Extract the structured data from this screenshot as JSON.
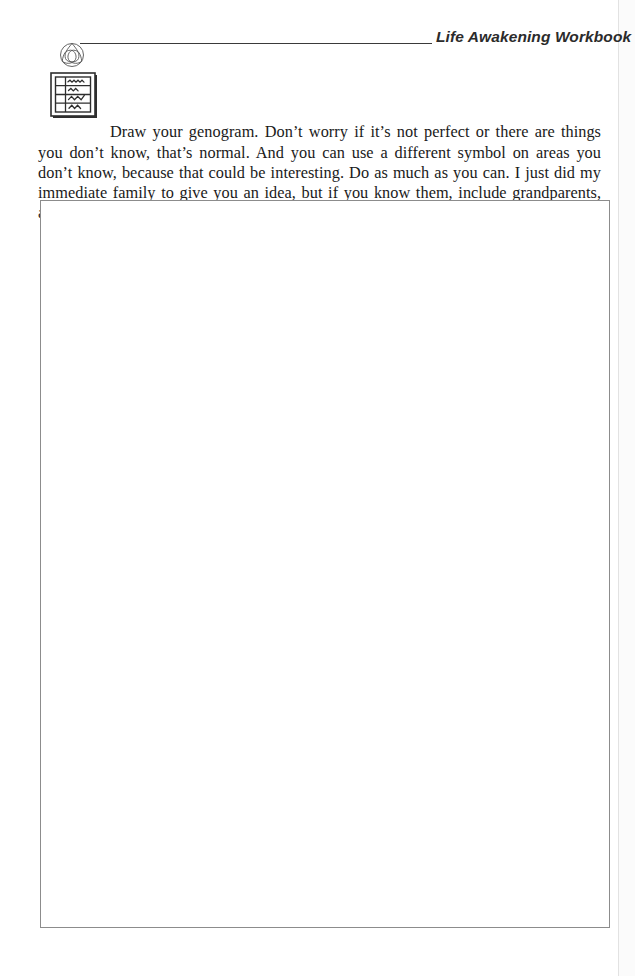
{
  "page": {
    "background_color": "#ffffff",
    "width": 635,
    "height": 976
  },
  "header": {
    "logo_icon": "triquetra-icon",
    "title": "Life Awakening Workbook",
    "rule_color": "#3a3a3a"
  },
  "instruction": {
    "icon": "worksheet-form-icon",
    "text": "Draw your genogram. Don’t worry if it’s not perfect or there are things you don’t know, that’s normal. And you can use a different symbol on areas you don’t know, because that could be interesting. Do as much as you can. I just did my immediate family to give you an idea, but if you know them, include grandparents, aunts, uncles etc."
  },
  "answer_area": {
    "label": "genogram-drawing-area",
    "content": "",
    "border_color": "#8c8c8c"
  }
}
